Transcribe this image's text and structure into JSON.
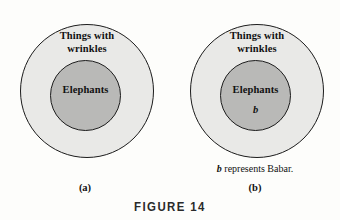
{
  "figure": {
    "caption": "FIGURE 14",
    "panels": [
      {
        "tag": "(a)",
        "outer_set_label": "Things with\nwrinkles",
        "outer_set_line1": "Things with",
        "outer_set_line2": "wrinkles",
        "inner_set_label": "Elephants",
        "element_label": "",
        "note": ""
      },
      {
        "tag": "(b)",
        "outer_set_label": "Things with\nwrinkles",
        "outer_set_line1": "Things with",
        "outer_set_line2": "wrinkles",
        "inner_set_label": "Elephants",
        "element_label": "b",
        "note_symbol": "b",
        "note_text": " represents Babar."
      }
    ]
  },
  "colors": {
    "page_background": "#fdfdfb",
    "outer_circle_fill": "#e9e9e7",
    "inner_circle_fill": "#b9b9b7",
    "circle_stroke": "#1c1c1c",
    "text": "#111111",
    "caption_text": "#2a2a2a"
  }
}
